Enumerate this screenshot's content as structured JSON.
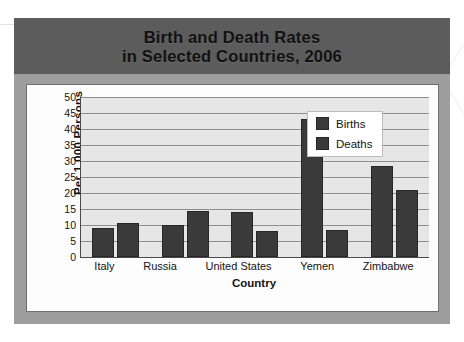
{
  "figure": {
    "title_line1": "Birth and Death Rates",
    "title_line2": "in Selected Countries, 2006"
  },
  "chart_data": {
    "type": "bar",
    "title": "Birth and Death Rates in Selected Countries, 2006",
    "xlabel": "Country",
    "ylabel": "Per 1,000  Persons",
    "categories": [
      "Italy",
      "Russia",
      "United States",
      "Yemen",
      "Zimbabwe"
    ],
    "series": [
      {
        "name": "Births",
        "values": [
          9,
          10,
          14,
          43,
          28.5
        ],
        "color": "#3a3a3a"
      },
      {
        "name": "Deaths",
        "values": [
          10.5,
          14.5,
          8,
          8.5,
          21
        ],
        "color": "#3a3a3a"
      }
    ],
    "ylim": [
      0,
      50
    ],
    "ytick_step": 5,
    "yticks": [
      50,
      45,
      40,
      35,
      30,
      25,
      20,
      15,
      10,
      5,
      0
    ],
    "grid": true,
    "legend_position": "top-right",
    "plot_background": "#e6e6e6",
    "banner_color": "#5c5c5c",
    "frame_color": "#9e9e9e"
  }
}
